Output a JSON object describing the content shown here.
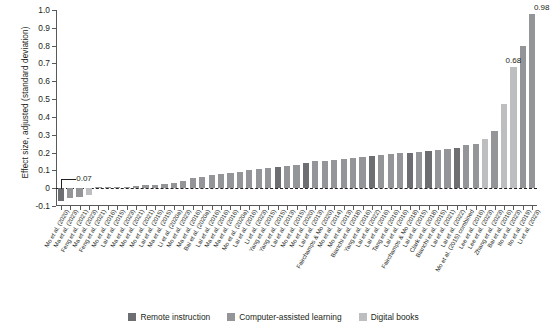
{
  "chart_data": {
    "type": "bar",
    "title": "",
    "xlabel": "",
    "ylabel": "Effect size, adjusted (standard deviation)",
    "ylim": [
      -0.1,
      1.0
    ],
    "ytick_labels": [
      "1.0",
      "0.9",
      "0.8",
      "0.7",
      "0.6",
      "0.5",
      "0.4",
      "0.3",
      "0.2",
      "0.1",
      "0",
      "-0.1"
    ],
    "ytick_values": [
      1.0,
      0.9,
      0.8,
      0.7,
      0.6,
      0.5,
      0.4,
      0.3,
      0.2,
      0.1,
      0.0,
      -0.1
    ],
    "grid": false,
    "zero_reference_line": true,
    "legend_position": "bottom",
    "legend": [
      {
        "name": "Remote instruction",
        "color": "#6d6e71"
      },
      {
        "name": "Computer-assisted learning",
        "color": "#939598"
      },
      {
        "name": "Digital books",
        "color": "#bcbec0"
      }
    ],
    "annotations": [
      {
        "text": "-0.07",
        "category_index": 0,
        "value": -0.07
      },
      {
        "text": "0.68",
        "category_index": 48,
        "value": 0.68
      },
      {
        "text": "0.98",
        "category_index": 51,
        "value": 0.98
      }
    ],
    "categories": [
      "Mo et al. (2020)",
      "Ma et al. (2023)",
      "Feng et al. (2021)",
      "Ma et al. (2023)",
      "Feng et al. (2021)",
      "Mo et al. (2016)",
      "Lai et al. (2015)",
      "Ma et al. (2023)",
      "Mo et al. (2021)",
      "Mo et al. (2021)",
      "Lai et al. (2015)",
      "Ma et al. (2015)",
      "Li et al. (2020a)",
      "Mo et al. (2023)",
      "Ma et al. (2016)",
      "Bai et al. (2020a)",
      "Lai et al. (2016)",
      "Ma et al. (2016)",
      "Ma et al. (2016)",
      "Mo et al. (2020a)",
      "Lai et al. (2016)",
      "Li et al. (2023)",
      "Yang et al. (2015)",
      "Yang et al. (2015)",
      "Lai et al. (2013)",
      "Mo et al. (2015)",
      "Mo et al. (2020)",
      "Lai et al. (2013)",
      "Fairchamps & Mo (2020)",
      "Mo et al. (2014)",
      "Mo et al. (2013)",
      "Bianchi et al. (2018)",
      "Yang et al. (2016)",
      "Lai et al. (2022)",
      "Lai et al. (2016)",
      "Tang et al. (2016)",
      "Lai et al. (2016)",
      "Fairchamps & Mo (2018)",
      "Lai et al. (2015)",
      "Clark et al. (2018)",
      "Bianchi et al. (2015)",
      "Lai et al. (2021)",
      "Lai et al. (2022)",
      "Mo et al. (2015) combined",
      "Lee et al. (2016)",
      "Lee et al. (2023)",
      "Zhang et al. (2023)",
      "Bai et al. (2016)",
      "Ito et al. (2023)",
      "Ito et al. (2019)",
      "Li et al. (2023)"
    ],
    "values": [
      -0.07,
      -0.055,
      -0.05,
      -0.038,
      0.0,
      0.004,
      0.006,
      0.008,
      0.012,
      0.016,
      0.02,
      0.024,
      0.03,
      0.04,
      0.055,
      0.065,
      0.072,
      0.08,
      0.085,
      0.09,
      0.1,
      0.105,
      0.112,
      0.118,
      0.125,
      0.13,
      0.14,
      0.15,
      0.155,
      0.16,
      0.165,
      0.17,
      0.175,
      0.18,
      0.185,
      0.19,
      0.195,
      0.2,
      0.205,
      0.21,
      0.215,
      0.22,
      0.225,
      0.24,
      0.25,
      0.275,
      0.32,
      0.47,
      0.68,
      0.8,
      0.98
    ],
    "series_group": [
      "remote",
      "computer",
      "computer",
      "digital",
      "computer",
      "computer",
      "computer",
      "computer",
      "computer",
      "computer",
      "computer",
      "computer",
      "computer",
      "computer",
      "computer",
      "computer",
      "computer",
      "computer",
      "computer",
      "computer",
      "computer",
      "computer",
      "computer",
      "remote",
      "computer",
      "computer",
      "remote",
      "computer",
      "computer",
      "computer",
      "computer",
      "computer",
      "computer",
      "remote",
      "computer",
      "computer",
      "computer",
      "remote",
      "computer",
      "remote",
      "computer",
      "computer",
      "remote",
      "computer",
      "computer",
      "digital",
      "computer",
      "digital",
      "digital",
      "computer",
      "computer"
    ]
  }
}
